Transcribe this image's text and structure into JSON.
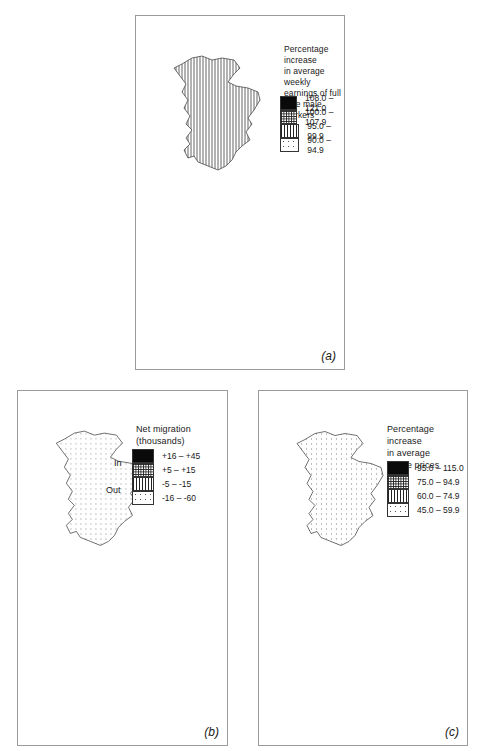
{
  "figure": {
    "panels": [
      {
        "id": "a",
        "label": "(a)",
        "legend": {
          "title": "Percentage increase\nin average weekly\nearnings of full\ntime male workers",
          "classes": [
            {
              "range": "108.0  –  121.0",
              "pattern": "solid"
            },
            {
              "range": "100.0  –  107.9",
              "pattern": "crosshatch"
            },
            {
              "range": "95.0  –  99.9",
              "pattern": "vertical"
            },
            {
              "range": "90.0  –  94.9",
              "pattern": "dots"
            }
          ]
        },
        "regions": {
          "scotland": "vertical",
          "north": "dots",
          "yorkshire": "dots",
          "north_west": "crosshatch",
          "wales": "vertical",
          "west_midlands": "vertical",
          "east_midlands": "vertical",
          "east_anglia": "crosshatch",
          "south_west": "solid",
          "south_east": "solid"
        }
      },
      {
        "id": "b",
        "label": "(b)",
        "legend": {
          "title": "Net migration\n(thousands)",
          "in_label": "In",
          "out_label": "Out",
          "classes": [
            {
              "range": "+16  –  +45",
              "pattern": "solid"
            },
            {
              "range": "+5  –  +15",
              "pattern": "crosshatch"
            },
            {
              "range": "-5  –  -15",
              "pattern": "vertical"
            },
            {
              "range": "-16  –  -60",
              "pattern": "dots"
            }
          ]
        },
        "regions": {
          "scotland": "dots",
          "north": "dots",
          "yorkshire": "dots",
          "north_west": "vertical",
          "wales": "crosshatch",
          "west_midlands": "dots",
          "east_midlands": "crosshatch",
          "east_anglia": "solid",
          "south_west": "solid",
          "south_east": "solid",
          "london": "vertical"
        }
      },
      {
        "id": "c",
        "label": "(c)",
        "legend": {
          "title": "Percentage increase\nin average\nhouse prices",
          "classes": [
            {
              "range": "95.0  –  115.0",
              "pattern": "solid"
            },
            {
              "range": "75.0  –  94.9",
              "pattern": "crosshatch"
            },
            {
              "range": "60.0  –  74.9",
              "pattern": "vertical"
            },
            {
              "range": "45.0  –  59.9",
              "pattern": "dots"
            }
          ]
        },
        "regions": {
          "scotland": "dots",
          "north": "dots",
          "yorkshire": "vertical",
          "north_west": "vertical",
          "wales": "vertical",
          "west_midlands": "dots",
          "east_midlands": "crosshatch",
          "east_anglia": "solid",
          "south_west": "crosshatch",
          "south_east": "solid"
        }
      }
    ]
  },
  "colors": {
    "ink": "#111111",
    "frame": "#9a9a9a",
    "background": "#ffffff"
  }
}
